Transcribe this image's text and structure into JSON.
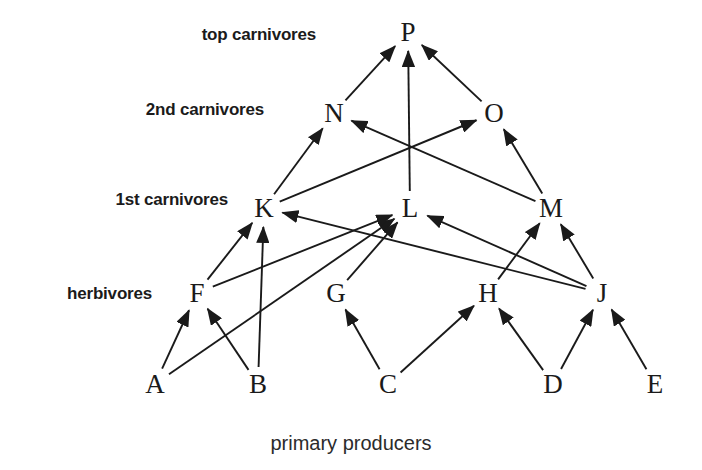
{
  "diagram": {
    "width": 702,
    "height": 470,
    "background_color": "#ffffff",
    "line_color": "#1a1a1a",
    "text_color": "#1a1a1a"
  },
  "trophic_labels": [
    {
      "id": "top-carnivores",
      "text": "top carnivores",
      "x": 316,
      "y": 35
    },
    {
      "id": "second-carnivores",
      "text": "2nd carnivores",
      "x": 264,
      "y": 110
    },
    {
      "id": "first-carnivores",
      "text": "1st carnivores",
      "x": 228,
      "y": 200
    },
    {
      "id": "herbivores",
      "text": "herbivores",
      "x": 152,
      "y": 294
    }
  ],
  "caption": {
    "text": "primary producers",
    "x": 351,
    "y": 443
  },
  "nodes": [
    {
      "id": "P",
      "label": "P",
      "x": 408,
      "y": 32,
      "level": "top carnivores"
    },
    {
      "id": "N",
      "label": "N",
      "x": 334,
      "y": 113,
      "level": "2nd carnivores"
    },
    {
      "id": "O",
      "label": "O",
      "x": 494,
      "y": 113,
      "level": "2nd carnivores"
    },
    {
      "id": "K",
      "label": "K",
      "x": 264,
      "y": 208,
      "level": "1st carnivores"
    },
    {
      "id": "L",
      "label": "L",
      "x": 410,
      "y": 208,
      "level": "1st carnivores"
    },
    {
      "id": "M",
      "label": "M",
      "x": 551,
      "y": 208,
      "level": "1st carnivores"
    },
    {
      "id": "F",
      "label": "F",
      "x": 197,
      "y": 293,
      "level": "herbivores"
    },
    {
      "id": "G",
      "label": "G",
      "x": 336,
      "y": 293,
      "level": "herbivores"
    },
    {
      "id": "H",
      "label": "H",
      "x": 488,
      "y": 293,
      "level": "herbivores"
    },
    {
      "id": "J",
      "label": "J",
      "x": 602,
      "y": 293,
      "level": "herbivores"
    },
    {
      "id": "A",
      "label": "A",
      "x": 155,
      "y": 384,
      "level": "primary producers"
    },
    {
      "id": "B",
      "label": "B",
      "x": 258,
      "y": 384,
      "level": "primary producers"
    },
    {
      "id": "C",
      "label": "C",
      "x": 388,
      "y": 384,
      "level": "primary producers"
    },
    {
      "id": "D",
      "label": "D",
      "x": 553,
      "y": 384,
      "level": "primary producers"
    },
    {
      "id": "E",
      "label": "E",
      "x": 655,
      "y": 384,
      "level": "primary producers"
    }
  ],
  "edges": [
    {
      "from": "A",
      "to": "F"
    },
    {
      "from": "A",
      "to": "L"
    },
    {
      "from": "B",
      "to": "F"
    },
    {
      "from": "B",
      "to": "K"
    },
    {
      "from": "C",
      "to": "G"
    },
    {
      "from": "C",
      "to": "H"
    },
    {
      "from": "D",
      "to": "H"
    },
    {
      "from": "D",
      "to": "J"
    },
    {
      "from": "E",
      "to": "J"
    },
    {
      "from": "F",
      "to": "K"
    },
    {
      "from": "F",
      "to": "L"
    },
    {
      "from": "G",
      "to": "L"
    },
    {
      "from": "H",
      "to": "M"
    },
    {
      "from": "J",
      "to": "K"
    },
    {
      "from": "J",
      "to": "L"
    },
    {
      "from": "J",
      "to": "M"
    },
    {
      "from": "K",
      "to": "N"
    },
    {
      "from": "K",
      "to": "O"
    },
    {
      "from": "L",
      "to": "P"
    },
    {
      "from": "M",
      "to": "N"
    },
    {
      "from": "M",
      "to": "O"
    },
    {
      "from": "N",
      "to": "P"
    },
    {
      "from": "O",
      "to": "P"
    }
  ]
}
